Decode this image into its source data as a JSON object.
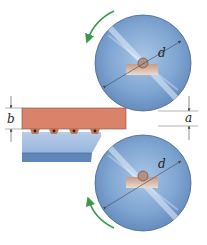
{
  "diagram": {
    "type": "rolling-mill-schematic",
    "labels": {
      "top_roller_diameter": "d",
      "bottom_roller_diameter": "d",
      "slab_thickness": "b",
      "roll_gap": "a"
    },
    "colors": {
      "roller_light": "#c9dcf0",
      "roller_mid": "#8fb2d8",
      "roller_dark": "#5f86b8",
      "roller_edge": "#4a6690",
      "slab": "#d9846a",
      "slab_edge": "#8a4a36",
      "plate": "#a9c3e2",
      "plate_dark": "#5f85b9",
      "arrow": "#3a9a4a",
      "hub_block": "#d8b8a8",
      "dimension_line": "#444444"
    },
    "rotation": {
      "top_roller": "counterclockwise",
      "bottom_roller": "clockwise"
    },
    "caption": ""
  }
}
